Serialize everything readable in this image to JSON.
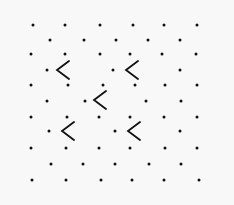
{
  "stimulus": {
    "background": "#f8f8f8",
    "foreground": "#111111",
    "dots": [
      [
        33,
        25
      ],
      [
        65,
        25
      ],
      [
        100,
        25
      ],
      [
        133,
        25
      ],
      [
        164,
        25
      ],
      [
        197,
        25
      ],
      [
        50,
        40
      ],
      [
        84,
        40
      ],
      [
        116,
        40
      ],
      [
        148,
        40
      ],
      [
        180,
        40
      ],
      [
        31,
        54
      ],
      [
        65,
        54
      ],
      [
        100,
        54
      ],
      [
        130,
        54
      ],
      [
        162,
        54
      ],
      [
        196,
        54
      ],
      [
        47,
        70
      ],
      [
        113,
        70
      ],
      [
        180,
        70
      ],
      [
        31,
        85
      ],
      [
        68,
        85
      ],
      [
        103,
        85
      ],
      [
        135,
        85
      ],
      [
        165,
        85
      ],
      [
        197,
        85
      ],
      [
        47,
        101
      ],
      [
        85,
        101
      ],
      [
        146,
        101
      ],
      [
        181,
        101
      ],
      [
        31,
        117
      ],
      [
        67,
        117
      ],
      [
        99,
        117
      ],
      [
        130,
        117
      ],
      [
        164,
        117
      ],
      [
        197,
        117
      ],
      [
        49,
        131
      ],
      [
        115,
        131
      ],
      [
        180,
        131
      ],
      [
        31,
        148
      ],
      [
        66,
        148
      ],
      [
        99,
        148
      ],
      [
        130,
        148
      ],
      [
        165,
        148
      ],
      [
        197,
        148
      ],
      [
        51,
        164
      ],
      [
        83,
        164
      ],
      [
        115,
        164
      ],
      [
        149,
        164
      ],
      [
        181,
        164
      ],
      [
        32,
        180
      ],
      [
        66,
        180
      ],
      [
        101,
        180
      ],
      [
        132,
        180
      ],
      [
        164,
        180
      ],
      [
        199,
        180
      ]
    ],
    "chevrons": [
      {
        "glyph": "<",
        "x": 63,
        "y": 70
      },
      {
        "glyph": "<",
        "x": 132,
        "y": 70
      },
      {
        "glyph": "<",
        "x": 100,
        "y": 100
      },
      {
        "glyph": "<",
        "x": 68,
        "y": 131
      },
      {
        "glyph": "<",
        "x": 134,
        "y": 131
      }
    ]
  }
}
